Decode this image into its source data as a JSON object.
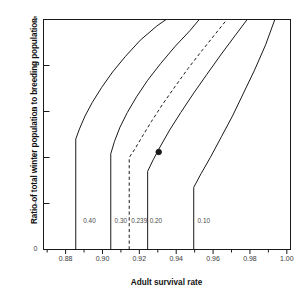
{
  "figure": {
    "background": "#ffffff",
    "line_color": "#1a1a1a",
    "text_color": "#111111"
  },
  "chart_data": {
    "type": "line",
    "title": "",
    "xlabel": "Adult survival rate",
    "ylabel": "Ratio of total winter population to breeding population",
    "xlim": [
      0.868,
      1.002
    ],
    "ylim": [
      0,
      5
    ],
    "grid": false,
    "legend": "inline-curve-labels",
    "xticks": [
      "0.88",
      "0.90",
      "0.92",
      "0.94",
      "0.96",
      "0.98",
      "1.00"
    ],
    "xtick_values": [
      0.88,
      0.9,
      0.92,
      0.94,
      0.96,
      0.98,
      1.0
    ],
    "xminor_ticks": [
      0.87,
      0.89,
      0.91,
      0.93,
      0.95,
      0.97,
      0.99
    ],
    "yticks": [
      "0",
      "1",
      "2",
      "3",
      "4",
      "5"
    ],
    "ytick_values": [
      0,
      1,
      2,
      3,
      4,
      5
    ],
    "series": [
      {
        "name": "0.40",
        "label": "0.40",
        "style": "solid",
        "label_x": 0.8885,
        "label_y": 0.62,
        "asymptote_x": 0.8855,
        "knee_y": 2.4,
        "points": [
          [
            0.8855,
            0.0
          ],
          [
            0.8855,
            2.4
          ],
          [
            0.8875,
            2.62
          ],
          [
            0.8905,
            2.9
          ],
          [
            0.8945,
            3.2
          ],
          [
            0.8995,
            3.52
          ],
          [
            0.9055,
            3.86
          ],
          [
            0.9125,
            4.2
          ],
          [
            0.9205,
            4.55
          ],
          [
            0.9295,
            4.86
          ],
          [
            0.9345,
            5.0
          ]
        ]
      },
      {
        "name": "0.30",
        "label": "0.30",
        "style": "solid",
        "label_x": 0.9055,
        "label_y": 0.62,
        "asymptote_x": 0.9045,
        "knee_y": 2.08,
        "points": [
          [
            0.9045,
            0.0
          ],
          [
            0.9045,
            2.08
          ],
          [
            0.9065,
            2.35
          ],
          [
            0.9095,
            2.66
          ],
          [
            0.9135,
            2.98
          ],
          [
            0.9185,
            3.32
          ],
          [
            0.9245,
            3.68
          ],
          [
            0.9315,
            4.04
          ],
          [
            0.9395,
            4.42
          ],
          [
            0.9475,
            4.76
          ],
          [
            0.9525,
            5.0
          ]
        ]
      },
      {
        "name": "0.239",
        "label": "0.239",
        "style": "dashed",
        "label_x": 0.9145,
        "label_y": 0.62,
        "asymptote_x": 0.9145,
        "knee_y": 2.0,
        "points": [
          [
            0.9145,
            0.0
          ],
          [
            0.9145,
            2.0
          ],
          [
            0.9175,
            2.18
          ],
          [
            0.9215,
            2.45
          ],
          [
            0.9265,
            2.78
          ],
          [
            0.9325,
            3.15
          ],
          [
            0.9395,
            3.55
          ],
          [
            0.9465,
            3.94
          ],
          [
            0.9545,
            4.35
          ],
          [
            0.9625,
            4.75
          ],
          [
            0.9675,
            5.0
          ]
        ]
      },
      {
        "name": "0.20",
        "label": "0.20",
        "style": "solid",
        "label_x": 0.9245,
        "label_y": 0.62,
        "asymptote_x": 0.9245,
        "knee_y": 1.7,
        "points": [
          [
            0.9245,
            0.0
          ],
          [
            0.9245,
            1.7
          ],
          [
            0.9275,
            1.95
          ],
          [
            0.9315,
            2.25
          ],
          [
            0.9365,
            2.6
          ],
          [
            0.9425,
            2.98
          ],
          [
            0.9495,
            3.4
          ],
          [
            0.9565,
            3.8
          ],
          [
            0.9645,
            4.25
          ],
          [
            0.9725,
            4.68
          ],
          [
            0.9785,
            5.0
          ]
        ]
      },
      {
        "name": "0.10",
        "label": "0.10",
        "style": "solid",
        "label_x": 0.9505,
        "label_y": 0.62,
        "asymptote_x": 0.9495,
        "knee_y": 1.35,
        "points": [
          [
            0.9495,
            0.0
          ],
          [
            0.9495,
            1.35
          ],
          [
            0.9535,
            1.65
          ],
          [
            0.9585,
            2.0
          ],
          [
            0.9645,
            2.45
          ],
          [
            0.9705,
            2.9
          ],
          [
            0.9765,
            3.4
          ],
          [
            0.9825,
            3.9
          ],
          [
            0.9885,
            4.45
          ],
          [
            0.9935,
            5.0
          ]
        ]
      }
    ],
    "markers": [
      {
        "name": "observed-point",
        "x": 0.9305,
        "y": 2.12,
        "shape": "filled-circle",
        "on_series": "0.239"
      }
    ]
  }
}
